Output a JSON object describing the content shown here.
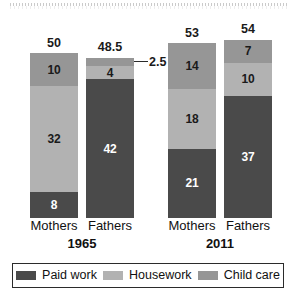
{
  "chart_data": {
    "type": "bar",
    "subtype": "stacked-bar",
    "title": "",
    "subtitle": "",
    "xlabel": "",
    "ylabel": "",
    "grid": false,
    "ylim": [
      0,
      54
    ],
    "legend_position": "bottom",
    "categories": [
      "Mothers",
      "Fathers",
      "Mothers",
      "Fathers"
    ],
    "groups": [
      {
        "label": "1965",
        "categories": [
          "Mothers",
          "Fathers"
        ]
      },
      {
        "label": "2011",
        "categories": [
          "Mothers",
          "Fathers"
        ]
      }
    ],
    "series": [
      {
        "name": "Paid work",
        "color": "#4a4a4a",
        "values": [
          8,
          42,
          21,
          37
        ]
      },
      {
        "name": "Housework",
        "color": "#b2b2b2",
        "values": [
          32,
          4,
          18,
          10
        ]
      },
      {
        "name": "Child care",
        "color": "#969696",
        "values": [
          10,
          2.5,
          14,
          7
        ]
      }
    ],
    "totals": [
      50,
      48.5,
      53,
      54
    ],
    "annotations": [
      {
        "text": "2.5",
        "target": "Fathers 1965 Child care",
        "style": "leader-line"
      }
    ]
  },
  "bars": [
    {
      "id": "mothers-1965",
      "category": "Mothers",
      "group": "1965",
      "total": "50",
      "segments": [
        {
          "name": "Child care",
          "value": "10",
          "label": "10",
          "color": "#969696",
          "text_on": "light",
          "show_label": true
        },
        {
          "name": "Housework",
          "value": "32",
          "label": "32",
          "color": "#b2b2b2",
          "text_on": "light",
          "show_label": true
        },
        {
          "name": "Paid work",
          "value": "8",
          "label": "8",
          "color": "#4a4a4a",
          "text_on": "dark",
          "show_label": true
        }
      ]
    },
    {
      "id": "fathers-1965",
      "category": "Fathers",
      "group": "1965",
      "total": "48.5",
      "callout": "2.5",
      "segments": [
        {
          "name": "Child care",
          "value": "2.5",
          "label": "2.5",
          "color": "#969696",
          "text_on": "light",
          "show_label": false
        },
        {
          "name": "Housework",
          "value": "4",
          "label": "4",
          "color": "#b2b2b2",
          "text_on": "light",
          "show_label": true
        },
        {
          "name": "Paid work",
          "value": "42",
          "label": "42",
          "color": "#4a4a4a",
          "text_on": "dark",
          "show_label": true
        }
      ]
    },
    {
      "id": "mothers-2011",
      "category": "Mothers",
      "group": "2011",
      "total": "53",
      "segments": [
        {
          "name": "Child care",
          "value": "14",
          "label": "14",
          "color": "#969696",
          "text_on": "light",
          "show_label": true
        },
        {
          "name": "Housework",
          "value": "18",
          "label": "18",
          "color": "#b2b2b2",
          "text_on": "light",
          "show_label": true
        },
        {
          "name": "Paid work",
          "value": "21",
          "label": "21",
          "color": "#4a4a4a",
          "text_on": "dark",
          "show_label": true
        }
      ]
    },
    {
      "id": "fathers-2011",
      "category": "Fathers",
      "group": "2011",
      "total": "54",
      "segments": [
        {
          "name": "Child care",
          "value": "7",
          "label": "7",
          "color": "#969696",
          "text_on": "light",
          "show_label": true
        },
        {
          "name": "Housework",
          "value": "10",
          "label": "10",
          "color": "#b2b2b2",
          "text_on": "light",
          "show_label": true
        },
        {
          "name": "Paid work",
          "value": "37",
          "label": "37",
          "color": "#4a4a4a",
          "text_on": "dark",
          "show_label": true
        }
      ]
    }
  ],
  "group_labels": [
    {
      "label": "1965"
    },
    {
      "label": "2011"
    }
  ],
  "legend": {
    "items": [
      {
        "label": "Paid work",
        "color": "#4a4a4a"
      },
      {
        "label": "Housework",
        "color": "#b2b2b2"
      },
      {
        "label": "Child care",
        "color": "#969696"
      }
    ]
  },
  "colors": {
    "paid_work": "#4a4a4a",
    "housework": "#b2b2b2",
    "child_care": "#969696",
    "text": "#111111",
    "legend_border": "#2b2b2b",
    "background": "#ffffff"
  }
}
